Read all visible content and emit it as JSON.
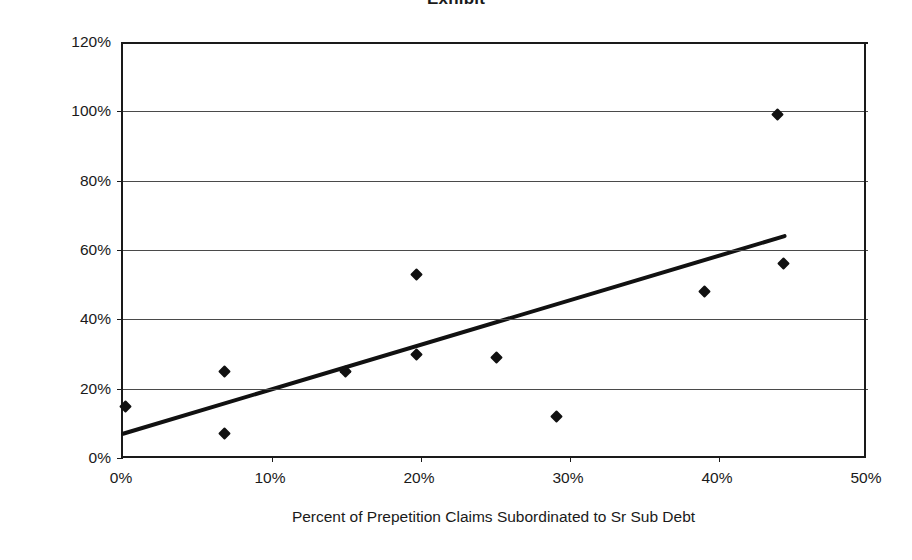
{
  "figure": {
    "title_remnant": "Exhibit",
    "background_color": "#ffffff",
    "marker_color": "#111111",
    "trendline_color": "#111111",
    "gridline_color": "#4a4a4a"
  },
  "chart_data": {
    "type": "scatter",
    "title": "",
    "xlabel": "Percent of Prepetition Claims Subordinated to Sr Sub Debt",
    "ylabel": "Present Value of Recoveries",
    "xlim": [
      0,
      50
    ],
    "ylim": [
      0,
      120
    ],
    "xtick_labels": [
      "0%",
      "10%",
      "20%",
      "30%",
      "40%",
      "50%"
    ],
    "xticks": [
      0,
      10,
      20,
      30,
      40,
      50
    ],
    "ytick_labels": [
      "0%",
      "20%",
      "40%",
      "60%",
      "80%",
      "100%",
      "120%"
    ],
    "yticks": [
      0,
      20,
      40,
      60,
      80,
      100,
      120
    ],
    "grid": "horizontal",
    "legend": "none",
    "series": [
      {
        "name": "Recoveries",
        "marker": "diamond",
        "points": [
          {
            "x": 0.2,
            "y": 15
          },
          {
            "x": 6.8,
            "y": 25
          },
          {
            "x": 6.8,
            "y": 7
          },
          {
            "x": 14.9,
            "y": 25
          },
          {
            "x": 19.7,
            "y": 53
          },
          {
            "x": 19.7,
            "y": 30
          },
          {
            "x": 25.1,
            "y": 29
          },
          {
            "x": 29.1,
            "y": 12
          },
          {
            "x": 39.0,
            "y": 48
          },
          {
            "x": 43.9,
            "y": 99
          },
          {
            "x": 44.3,
            "y": 56
          }
        ]
      }
    ],
    "trendline": {
      "name": "linear-fit",
      "x_start": 0,
      "y_start": 7,
      "x_end": 44.4,
      "y_end": 64
    }
  }
}
